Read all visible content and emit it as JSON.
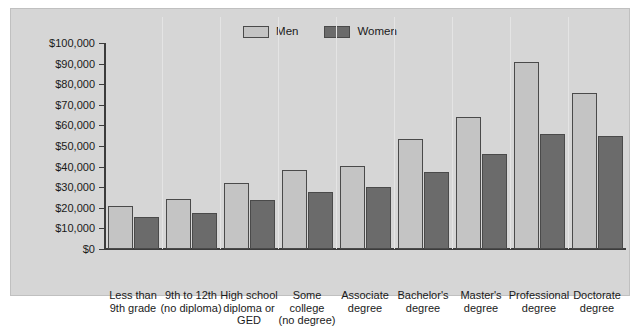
{
  "colors": {
    "panel_background": "#d6d6d6",
    "men_bar": "#c4c4c4",
    "women_bar": "#6b6b6b",
    "axis": "#3c3c3c",
    "text": "#1a1a1a"
  },
  "legend": {
    "position": "top-center",
    "entries": [
      {
        "label": "Men",
        "color": "#c4c4c4"
      },
      {
        "label": "Women",
        "color": "#6b6b6b"
      }
    ]
  },
  "chart_data": {
    "type": "bar",
    "title": "",
    "subtitle": "",
    "xlabel": "",
    "ylabel": "",
    "ylim": [
      0,
      100000
    ],
    "grid": false,
    "legend_position": "top-center",
    "ytick_labels": [
      "$0",
      "$10,000",
      "$20,000",
      "$30,000",
      "$40,000",
      "$50,000",
      "$60,000",
      "$70,000",
      "$80,000",
      "$90,000",
      "$100,000"
    ],
    "ytick_values": [
      0,
      10000,
      20000,
      30000,
      40000,
      50000,
      60000,
      70000,
      80000,
      90000,
      100000
    ],
    "categories": [
      "Less than\n9th grade",
      "9th to 12th\n(no diploma)",
      "High school\ndiploma or\nGED",
      "Some\ncollege\n(no degree)",
      "Associate\ndegree",
      "Bachelor's\ndegree",
      "Master's\ndegree",
      "Professional\ndegree",
      "Doctorate\ndegree"
    ],
    "series": [
      {
        "name": "Men",
        "color": "#c4c4c4",
        "values": [
          21000,
          24500,
          32000,
          38500,
          40500,
          53500,
          64000,
          91000,
          75500
        ]
      },
      {
        "name": "Women",
        "color": "#6b6b6b",
        "values": [
          15500,
          17500,
          24000,
          27500,
          30000,
          37500,
          46000,
          56000,
          55000
        ]
      }
    ]
  }
}
